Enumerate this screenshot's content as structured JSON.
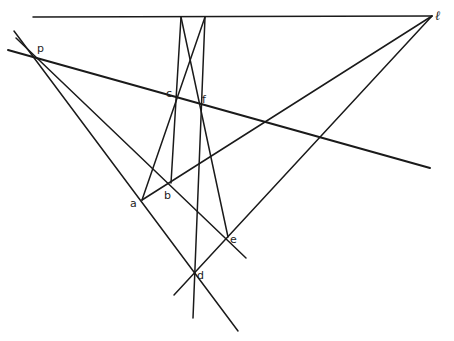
{
  "diagram": {
    "type": "projective-geometry-construction",
    "stroke_color": "#1a1a1a",
    "labels": {
      "p": "p",
      "a": "a",
      "b": "b",
      "c": "c",
      "f": "f",
      "e": "e",
      "d": "d",
      "ell": "ℓ"
    },
    "points": {
      "p": [
        35,
        56
      ],
      "a": [
        142,
        200
      ],
      "b": [
        171,
        183
      ],
      "c": [
        176,
        93
      ],
      "f": [
        201,
        100
      ],
      "e": [
        228,
        237
      ],
      "d": [
        195,
        272
      ],
      "ell_vertex": [
        432,
        16
      ]
    },
    "lines": [
      {
        "name": "line-ell",
        "from": [
          33,
          17
        ],
        "to": [
          432,
          16
        ]
      },
      {
        "name": "line-pc",
        "from": [
          8,
          50
        ],
        "to": [
          430,
          168
        ]
      },
      {
        "name": "line-pd",
        "from": [
          14,
          31
        ],
        "to": [
          238,
          331
        ]
      },
      {
        "name": "line-pe",
        "from": [
          16,
          38
        ],
        "to": [
          246,
          258
        ]
      },
      {
        "name": "line-a-ell",
        "from": [
          142,
          200
        ],
        "to": [
          432,
          16
        ]
      },
      {
        "name": "line-d-ell",
        "from": [
          174,
          295
        ],
        "to": [
          432,
          16
        ]
      },
      {
        "name": "line-ac",
        "from": [
          142,
          200
        ],
        "to": [
          205,
          17
        ]
      },
      {
        "name": "line-b-top",
        "from": [
          171,
          183
        ],
        "to": [
          181,
          17
        ]
      },
      {
        "name": "line-vertical-d",
        "from": [
          205,
          17
        ],
        "to": [
          193,
          318
        ]
      },
      {
        "name": "line-e-top",
        "from": [
          228,
          237
        ],
        "to": [
          181,
          17
        ]
      }
    ]
  }
}
